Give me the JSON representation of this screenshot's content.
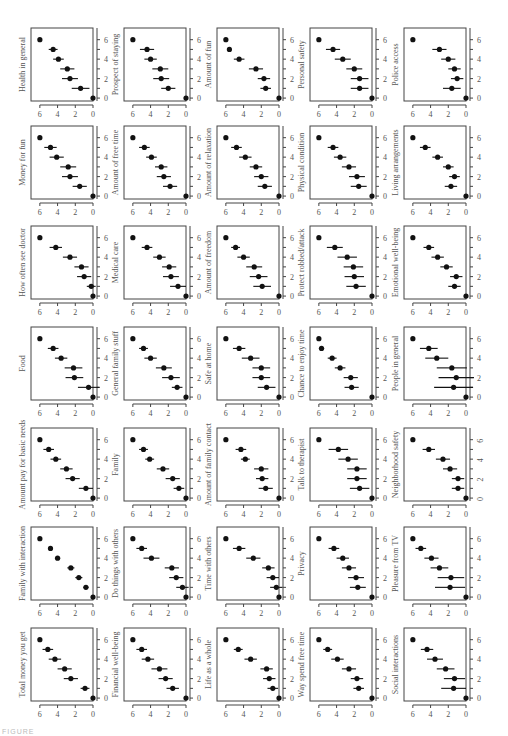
{
  "figure": {
    "caption_fragment": "FIGURE"
  },
  "chart_data": {
    "type": "scatter",
    "layout": "grid 7 rows x 5 columns of dot-and-whisker panels",
    "x_axis": {
      "ticks": [
        6,
        4,
        2,
        0
      ],
      "reversed": true,
      "range": [
        7,
        0
      ]
    },
    "y_axis": {
      "ticks": [
        0,
        2,
        4,
        6
      ],
      "position": "right",
      "range": [
        -0.3,
        7.2
      ]
    },
    "grid": false,
    "panels": [
      {
        "label": "Health in general",
        "row": 0,
        "col": 0,
        "x": [
          0,
          1.4,
          2.6,
          2.9,
          3.9,
          4.5,
          6.0
        ],
        "err": [
          0,
          1.0,
          0.9,
          0.8,
          0.6,
          0.5,
          0
        ]
      },
      {
        "label": "Prospect of staying",
        "row": 0,
        "col": 1,
        "x": [
          0,
          2.0,
          2.8,
          2.9,
          4.0,
          4.4,
          6.0
        ],
        "err": [
          0,
          0.8,
          0.9,
          0.9,
          0.7,
          0.8,
          0
        ]
      },
      {
        "label": "Amount of fun",
        "row": 0,
        "col": 2,
        "x": [
          0,
          1.5,
          1.7,
          2.6,
          4.5,
          5.6,
          6.0
        ],
        "err": [
          0,
          0.6,
          0.7,
          0.8,
          0.6,
          0.2,
          0
        ]
      },
      {
        "label": "Personal safety",
        "row": 0,
        "col": 3,
        "x": [
          0,
          1.4,
          1.4,
          2.0,
          3.3,
          4.4,
          6.0
        ],
        "err": [
          0,
          1.0,
          1.0,
          0.9,
          0.9,
          0.8,
          0
        ]
      },
      {
        "label": "Police access",
        "row": 0,
        "col": 4,
        "x": [
          0,
          1.6,
          1.0,
          1.3,
          2.0,
          3.0,
          6.0
        ],
        "err": [
          0,
          1.0,
          0.7,
          0.7,
          0.8,
          0.8,
          0
        ]
      },
      {
        "label": "Money for fun",
        "row": 1,
        "col": 0,
        "x": [
          0,
          1.5,
          2.6,
          2.8,
          4.1,
          4.8,
          6.0
        ],
        "err": [
          0,
          0.8,
          0.9,
          0.9,
          0.8,
          0.7,
          0
        ]
      },
      {
        "label": "Amount of free time",
        "row": 1,
        "col": 1,
        "x": [
          0,
          1.8,
          2.5,
          2.8,
          3.9,
          4.7,
          6.0
        ],
        "err": [
          0,
          0.8,
          0.8,
          0.7,
          0.6,
          0.6,
          0
        ]
      },
      {
        "label": "Amount of relaxation",
        "row": 1,
        "col": 2,
        "x": [
          0,
          1.6,
          2.0,
          2.6,
          3.8,
          4.8,
          6.0
        ],
        "err": [
          0,
          0.8,
          0.8,
          0.7,
          0.7,
          0.6,
          0
        ]
      },
      {
        "label": "Physical condition",
        "row": 1,
        "col": 3,
        "x": [
          0,
          1.5,
          1.7,
          2.6,
          3.6,
          4.4,
          6.0
        ],
        "err": [
          0,
          0.9,
          0.9,
          0.8,
          0.7,
          0.6,
          0
        ]
      },
      {
        "label": "Living arrangements",
        "row": 1,
        "col": 4,
        "x": [
          0,
          1.7,
          1.3,
          2.0,
          3.2,
          4.6,
          6.0
        ],
        "err": [
          0,
          0.7,
          0.6,
          0.6,
          0.6,
          0.6,
          0
        ]
      },
      {
        "label": "How often see doctor",
        "row": 2,
        "col": 0,
        "x": [
          0,
          0.2,
          1.0,
          1.3,
          2.6,
          4.2,
          6.0
        ],
        "err": [
          0,
          0.5,
          0.8,
          0.8,
          0.8,
          0.7,
          0
        ]
      },
      {
        "label": "Medical care",
        "row": 2,
        "col": 1,
        "x": [
          0,
          0.9,
          1.7,
          1.9,
          3.0,
          4.4,
          6.0
        ],
        "err": [
          0,
          0.9,
          0.9,
          0.8,
          0.7,
          0.6,
          0
        ]
      },
      {
        "label": "Amount of freedom",
        "row": 2,
        "col": 2,
        "x": [
          0,
          1.9,
          2.3,
          2.8,
          4.0,
          4.9,
          6.0
        ],
        "err": [
          0,
          1.0,
          1.0,
          0.9,
          0.7,
          0.5,
          0
        ]
      },
      {
        "label": "Protect robbed/attack",
        "row": 2,
        "col": 3,
        "x": [
          0,
          1.8,
          2.0,
          2.1,
          2.8,
          4.2,
          6.0
        ],
        "err": [
          0,
          1.1,
          1.1,
          1.1,
          1.1,
          0.9,
          0
        ]
      },
      {
        "label": "Emotional well-being",
        "row": 2,
        "col": 4,
        "x": [
          0,
          1.3,
          1.1,
          2.2,
          3.2,
          4.2,
          6.0
        ],
        "err": [
          0,
          0.7,
          0.7,
          0.7,
          0.7,
          0.6,
          0
        ]
      },
      {
        "label": "Food",
        "row": 3,
        "col": 0,
        "x": [
          0,
          0.5,
          2.1,
          2.2,
          3.6,
          4.5,
          6.0
        ],
        "err": [
          0,
          1.2,
          1.0,
          1.0,
          0.7,
          0.6,
          0
        ]
      },
      {
        "label": "General family stuff",
        "row": 3,
        "col": 1,
        "x": [
          0,
          1.0,
          1.7,
          2.5,
          4.0,
          4.8,
          6.0
        ],
        "err": [
          0,
          0.6,
          1.0,
          0.9,
          0.7,
          0.5,
          0
        ]
      },
      {
        "label": "Safe at home",
        "row": 3,
        "col": 2,
        "x": [
          0,
          1.4,
          2.0,
          2.0,
          3.2,
          4.5,
          6.0
        ],
        "err": [
          0,
          1.0,
          1.0,
          1.0,
          1.0,
          0.7,
          0
        ]
      },
      {
        "label": "Chance to enjoy time",
        "row": 3,
        "col": 3,
        "x": [
          0,
          2.3,
          2.4,
          3.6,
          4.5,
          5.7,
          6.0
        ],
        "err": [
          0,
          0.8,
          0.8,
          0.6,
          0.5,
          0.3,
          0
        ]
      },
      {
        "label": "People in general",
        "row": 3,
        "col": 4,
        "x": [
          0,
          1.4,
          1.1,
          1.6,
          3.3,
          4.2,
          6.0
        ],
        "err": [
          0,
          2.2,
          2.0,
          1.7,
          1.3,
          1.0,
          0
        ]
      },
      {
        "label": "Amount pay for basic needs",
        "row": 4,
        "col": 0,
        "x": [
          0,
          0.8,
          2.3,
          3.0,
          4.2,
          5.0,
          6.0
        ],
        "err": [
          0,
          0.8,
          0.8,
          0.7,
          0.6,
          0.6,
          0
        ]
      },
      {
        "label": "Family",
        "row": 4,
        "col": 1,
        "x": [
          0,
          0.8,
          1.5,
          2.6,
          4.1,
          4.8,
          6.0
        ],
        "err": [
          0,
          0.6,
          0.8,
          0.7,
          0.5,
          0.5,
          0
        ]
      },
      {
        "label": "Amount of family contact",
        "row": 4,
        "col": 2,
        "x": [
          0,
          1.5,
          1.9,
          2.0,
          3.8,
          4.3,
          6.0
        ],
        "err": [
          0,
          0.8,
          0.7,
          0.8,
          0.5,
          0.6,
          0
        ]
      },
      {
        "label": "Talk to therapist",
        "row": 4,
        "col": 3,
        "x": [
          0,
          1.4,
          1.7,
          1.7,
          2.7,
          3.8,
          6.0
        ],
        "err": [
          0,
          1.1,
          1.1,
          1.1,
          1.1,
          1.1,
          0
        ]
      },
      {
        "label": "Neighborhood safety",
        "row": 4,
        "col": 4,
        "x": [
          0,
          0.9,
          0.9,
          1.8,
          2.6,
          4.2,
          6.0
        ],
        "err": [
          0,
          0.7,
          0.7,
          0.8,
          0.8,
          0.7,
          0
        ]
      },
      {
        "label": "Family with interaction",
        "row": 5,
        "col": 0,
        "x": [
          0,
          0.8,
          1.6,
          2.5,
          4.0,
          4.8,
          6.0
        ],
        "err": [
          0,
          0.3,
          0.4,
          0.4,
          0.3,
          0.2,
          0
        ]
      },
      {
        "label": "Do things with others",
        "row": 5,
        "col": 1,
        "x": [
          0,
          0.4,
          1.1,
          1.6,
          3.9,
          5.0,
          6.0
        ],
        "err": [
          0,
          0.7,
          0.8,
          0.8,
          0.9,
          0.6,
          0
        ]
      },
      {
        "label": "Time with others",
        "row": 5,
        "col": 2,
        "x": [
          0,
          0.3,
          0.7,
          1.2,
          2.9,
          4.5,
          6.0
        ],
        "err": [
          0,
          0.7,
          0.7,
          0.7,
          0.8,
          0.7,
          0
        ]
      },
      {
        "label": "Privacy",
        "row": 5,
        "col": 3,
        "x": [
          0,
          1.6,
          1.8,
          2.6,
          3.3,
          4.3,
          6.0
        ],
        "err": [
          0,
          0.9,
          0.9,
          0.8,
          0.7,
          0.6,
          0
        ]
      },
      {
        "label": "Pleasure from TV",
        "row": 5,
        "col": 4,
        "x": [
          0,
          1.8,
          1.7,
          3.0,
          3.9,
          5.1,
          6.0
        ],
        "err": [
          0,
          1.7,
          1.5,
          1.0,
          0.8,
          0.6,
          0
        ]
      },
      {
        "label": "Total money you get",
        "row": 6,
        "col": 0,
        "x": [
          0,
          0.9,
          2.5,
          3.2,
          4.3,
          5.1,
          6.0
        ],
        "err": [
          0,
          0.5,
          0.8,
          0.8,
          0.7,
          0.6,
          0
        ]
      },
      {
        "label": "Financial well-being",
        "row": 6,
        "col": 1,
        "x": [
          0,
          1.5,
          2.3,
          3.0,
          4.3,
          5.0,
          6.0
        ],
        "err": [
          0,
          0.7,
          0.8,
          0.9,
          0.7,
          0.6,
          0
        ]
      },
      {
        "label": "Life as a whole",
        "row": 6,
        "col": 2,
        "x": [
          0,
          0.7,
          1.1,
          1.4,
          3.2,
          4.6,
          6.0
        ],
        "err": [
          0,
          0.6,
          0.7,
          0.7,
          0.7,
          0.5,
          0
        ]
      },
      {
        "label": "Way spend free time",
        "row": 6,
        "col": 3,
        "x": [
          0,
          1.5,
          1.7,
          2.6,
          3.9,
          5.0,
          6.0
        ],
        "err": [
          0,
          0.6,
          0.7,
          0.8,
          0.7,
          0.5,
          0
        ]
      },
      {
        "label": "Social interactions",
        "row": 6,
        "col": 4,
        "x": [
          0,
          1.4,
          1.3,
          2.3,
          3.5,
          4.4,
          6.0
        ],
        "err": [
          0,
          1.4,
          1.2,
          1.0,
          0.9,
          0.7,
          0
        ]
      }
    ]
  }
}
